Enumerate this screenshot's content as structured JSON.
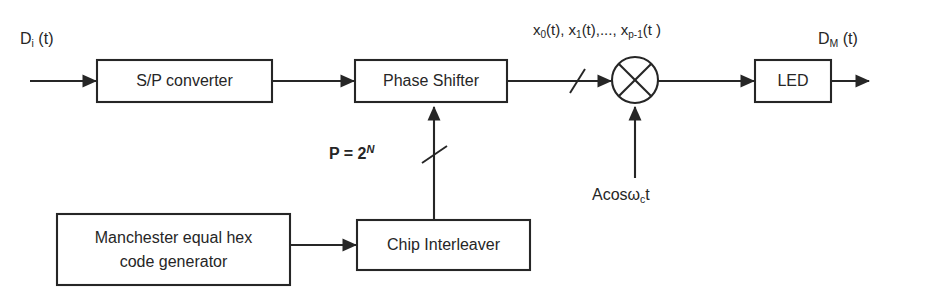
{
  "diagram": {
    "stroke_color": "#262626",
    "background_color": "#ffffff",
    "blocks": [
      {
        "id": "sp_converter",
        "label": "S/P converter"
      },
      {
        "id": "phase_shifter",
        "label": "Phase Shifter"
      },
      {
        "id": "led",
        "label": "LED"
      },
      {
        "id": "manchester",
        "label": "Manchester equal hex\ncode generator"
      },
      {
        "id": "chip_interleaver",
        "label": "Chip Interleaver"
      }
    ],
    "mixer": {
      "id": "mixer",
      "symbol": "multiplier-x"
    },
    "labels": {
      "input_signal": "D",
      "input_signal_sub": "i",
      "input_signal_tail": " (t)",
      "output_signal": "D",
      "output_signal_sub": "M",
      "output_signal_tail": " (t)",
      "parallel_streams_x0": "x",
      "parallel_streams_x0_sub": "0",
      "parallel_streams_mid": "(t), x",
      "parallel_streams_x1_sub": "1",
      "parallel_streams_mid2": "(t),..., x",
      "parallel_streams_xp_sub": "p-1",
      "parallel_streams_tail": "(t )",
      "p_equation_lead": "P = 2",
      "p_equation_exp": "N",
      "carrier_lead": "Acos",
      "carrier_omega": "ω",
      "carrier_sub": "c",
      "carrier_tail": "t"
    }
  }
}
